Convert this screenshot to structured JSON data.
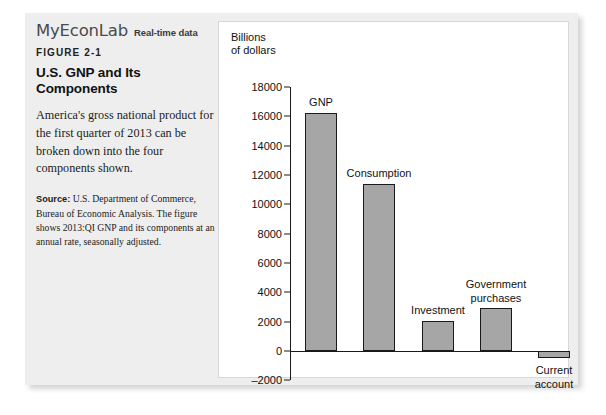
{
  "brand": {
    "logo": "MyEconLab",
    "tagline": "Real-time data"
  },
  "figure": {
    "number": "FIGURE 2-1",
    "title": "U.S. GNP and Its Components",
    "description": "America's gross national product for the first quarter of 2013 can be broken down into the four components shown.",
    "source_label": "Source:",
    "source_text": " U.S. Department of Commerce, Bureau of Economic Analysis. The figure shows 2013:QI GNP and its components at an annual rate, seasonally adjusted."
  },
  "chart_data": {
    "type": "bar",
    "title": "U.S. GNP and Its Components",
    "xlabel": "",
    "ylabel": "Billions\nof dollars",
    "ylim": [
      -2000,
      18000
    ],
    "yticks": [
      18000,
      16000,
      14000,
      12000,
      10000,
      8000,
      6000,
      4000,
      2000,
      0,
      -2000
    ],
    "ytick_labels": [
      "18000",
      "16000",
      "14000",
      "12000",
      "10000",
      "8000",
      "6000",
      "4000",
      "2000",
      "0",
      "-2000"
    ],
    "grid": false,
    "legend": "none",
    "bar_color": "#a6a6a6",
    "bar_edge_color": "#1a1a1a",
    "categories": [
      "GNP",
      "Consumption",
      "Investment",
      "Government purchases",
      "Current account"
    ],
    "values": [
      16200,
      11400,
      2050,
      2900,
      -500
    ],
    "labels": [
      "GNP",
      "Consumption",
      "Investment",
      "Government\npurchases",
      "Current\naccount"
    ]
  }
}
